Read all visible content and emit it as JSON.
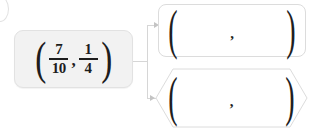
{
  "diagram": {
    "corner_glyph": "circle-icon",
    "source": {
      "name": "ordered-pair-source",
      "open_paren": "(",
      "close_paren": ")",
      "comma": ",",
      "first_fraction": {
        "numerator": "7",
        "denominator": "10"
      },
      "second_fraction": {
        "numerator": "1",
        "denominator": "4"
      }
    },
    "connector": {
      "arrow_icon": "arrow-right-icon",
      "branches": 2
    },
    "answers": [
      {
        "name": "answer-box-rectangle",
        "shape": "rounded-rectangle",
        "open_paren": "(",
        "close_paren": ")",
        "comma": ",",
        "value": "",
        "placeholder": ""
      },
      {
        "name": "answer-box-hexagon",
        "shape": "hexagon",
        "open_paren": "(",
        "close_paren": ")",
        "comma": ",",
        "value": "",
        "placeholder": ""
      }
    ],
    "colors": {
      "source_fill": "#f2f2f2",
      "source_border": "#e2e2e2",
      "answer_border": "#dcdcdc",
      "connector": "#d6d6d6",
      "text": "#1d1d1d",
      "background": "#ffffff"
    }
  }
}
